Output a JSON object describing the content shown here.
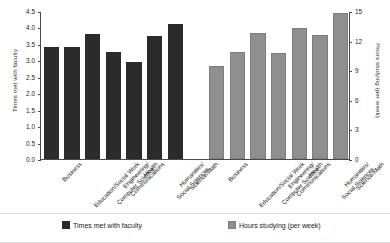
{
  "chart_data": {
    "type": "bar",
    "title": "",
    "xlabel": "",
    "grid": false,
    "legend_position": "bottom",
    "categories": [
      "Business",
      "Education/Social Work",
      "Engineering/\nComputer Science",
      "Communications",
      "Health",
      "Humanities/\nSocial Sciences",
      "Science/Math"
    ],
    "series": [
      {
        "name": "Times met with faculty",
        "axis": "left",
        "color": "#2b2b2b",
        "values": [
          3.4,
          3.4,
          3.8,
          3.25,
          2.95,
          3.75,
          4.1
        ]
      },
      {
        "name": "Hours studying (per week)",
        "axis": "right",
        "color": "#8f8f8f",
        "values": [
          9.4,
          10.8,
          12.8,
          10.7,
          13.3,
          12.6,
          14.8
        ]
      }
    ],
    "left_axis": {
      "label": "Times met with faculty",
      "ylim": [
        0.0,
        4.5
      ],
      "ticks": [
        "0.0",
        "0.5",
        "1.0",
        "1.5",
        "2.0",
        "2.5",
        "3.0",
        "3.5",
        "4.0",
        "4.5"
      ],
      "tick_values": [
        0.0,
        0.5,
        1.0,
        1.5,
        2.0,
        2.5,
        3.0,
        3.5,
        4.0,
        4.5
      ]
    },
    "right_axis": {
      "label": "Hours studying (per week)",
      "ylim": [
        0,
        15
      ],
      "ticks": [
        "0",
        "3",
        "6",
        "9",
        "12",
        "15"
      ],
      "tick_values": [
        0,
        3,
        6,
        9,
        12,
        15
      ]
    }
  },
  "legend": {
    "items": [
      {
        "label": "Times met with faculty",
        "swatch": "dark"
      },
      {
        "label": "Hours studying (per week)",
        "swatch": "gray"
      }
    ]
  }
}
